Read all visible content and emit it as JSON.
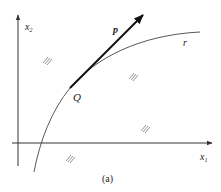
{
  "figure": {
    "caption": "(a)",
    "axes": {
      "x_label": "x",
      "x_sub": "1",
      "y_label": "x",
      "y_sub": "2"
    },
    "curve_label": "r",
    "vector_label": "p",
    "point_label": "Q",
    "hatch_symbol": "///",
    "colors": {
      "line": "#333333",
      "vector": "#111111",
      "background": "#ffffff"
    }
  }
}
